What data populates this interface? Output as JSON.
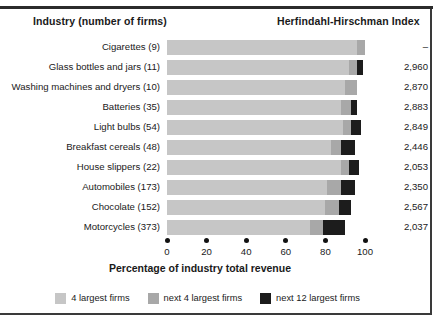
{
  "headers": {
    "industry": "Industry (number of firms)",
    "hhi": "Herfindahl-Hirschman Index"
  },
  "chart_data": {
    "type": "bar",
    "subtype": "horizontal-stacked",
    "title": "",
    "xlabel": "Percentage of industry total revenue",
    "ylabel": "",
    "xlim": [
      0,
      100
    ],
    "xticks": [
      0,
      20,
      40,
      60,
      80,
      100
    ],
    "grid": false,
    "legend_position": "bottom",
    "colors": {
      "s1": "#c6c6c6",
      "s2": "#a8a8a8",
      "s3": "#1c1c1c"
    },
    "series": [
      {
        "name": "4 largest firms",
        "key": "s1",
        "values": [
          96,
          92,
          90,
          88,
          89,
          83,
          88,
          81,
          80,
          72
        ]
      },
      {
        "name": "next 4 largest firms",
        "key": "s2",
        "values": [
          4,
          4,
          6,
          5,
          4,
          5,
          4,
          7,
          7,
          7
        ]
      },
      {
        "name": "next 12 largest firms",
        "key": "s3",
        "values": [
          0,
          3,
          0,
          3,
          5,
          7,
          5,
          7,
          6,
          11
        ]
      }
    ],
    "categories": [
      "Cigarettes  (9)",
      "Glass bottles and jars  (11)",
      "Washing machines and dryers  (10)",
      "Batteries  (35)",
      "Light bulbs  (54)",
      "Breakfast cereals  (48)",
      "House slippers  (22)",
      "Automobiles  (173)",
      "Chocolate  (152)",
      "Motorcycles  (373)"
    ],
    "hhi_values": [
      "–",
      "2,960",
      "2,870",
      "2,883",
      "2,849",
      "2,446",
      "2,053",
      "2,350",
      "2,567",
      "2,037"
    ]
  }
}
